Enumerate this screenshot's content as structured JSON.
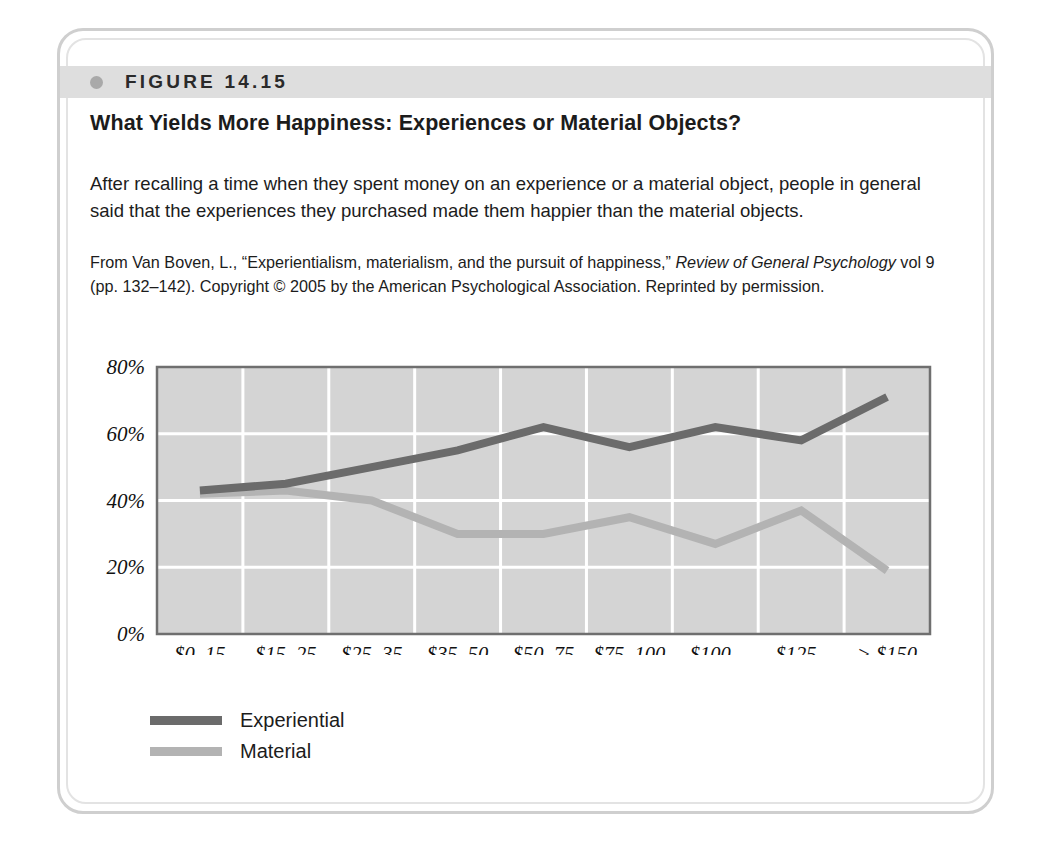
{
  "figure": {
    "number": "FIGURE 14.15",
    "title": "What Yields More Happiness: Experiences or Material Objects?",
    "caption": "After recalling a time when they spent money on an experience or a material object, people in general said that the experiences they purchased made them happier than the material objects.",
    "source_prefix": "From Van Boven, L., “Experientialism, materialism, and the pursuit of happiness,” ",
    "source_journal": "Review of General Psychology",
    "source_suffix": " vol 9 (pp. 132–142). Copyright © 2005 by the American Psychological Association. Reprinted by permission."
  },
  "colors": {
    "plot_background": "#d4d4d4",
    "gridline": "#ffffff",
    "axis": "#6f6f6f",
    "experiential": "#6b6b6b",
    "material": "#b3b3b3",
    "band": "#dedede",
    "frame": "#cfcfcf"
  },
  "chart_data": {
    "type": "line",
    "title": "What Yields More Happiness: Experiences or Material Objects?",
    "xlabel": "",
    "ylabel": "",
    "ylim": [
      0,
      80
    ],
    "yticks": [
      0,
      20,
      40,
      60,
      80
    ],
    "ytick_labels": [
      "0%",
      "20%",
      "40%",
      "60%",
      "80%"
    ],
    "grid": true,
    "legend_position": "below-left",
    "categories": [
      "$0–15",
      "$15–25",
      "$25–35",
      "$35–50",
      "$50–75",
      "$75–100",
      "$100–125",
      "$125–150",
      "> $150"
    ],
    "category_lines": [
      [
        "$0–15"
      ],
      [
        "$15–25"
      ],
      [
        "$25–35"
      ],
      [
        "$35–50"
      ],
      [
        "$50–75"
      ],
      [
        "$75–100"
      ],
      [
        "$100–",
        "125"
      ],
      [
        "$125–",
        "150"
      ],
      [
        "> $150"
      ]
    ],
    "series": [
      {
        "name": "Experiential",
        "color": "#6b6b6b",
        "values": [
          43,
          45,
          50,
          55,
          62,
          56,
          62,
          58,
          71
        ]
      },
      {
        "name": "Material",
        "color": "#b3b3b3",
        "values": [
          42,
          43,
          40,
          30,
          30,
          35,
          27,
          37,
          19
        ]
      }
    ]
  },
  "legend": {
    "items": [
      {
        "label": "Experiential",
        "color": "#6b6b6b"
      },
      {
        "label": "Material",
        "color": "#b3b3b3"
      }
    ]
  }
}
